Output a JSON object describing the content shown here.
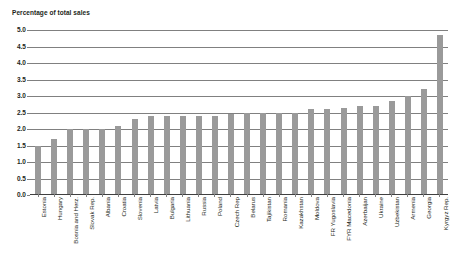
{
  "chart_data": {
    "type": "bar",
    "title": "Percentage of total sales",
    "subtitle": "",
    "xlabel": "",
    "ylabel": "Percentage of total sales",
    "ylim": [
      0.0,
      5.0
    ],
    "ytick_labels": [
      "5.0",
      "4.5",
      "4.0",
      "3.5",
      "3.0",
      "2.5",
      "2.0",
      "1.5",
      "1.0",
      "0.5",
      "0.0"
    ],
    "ytick_values": [
      5.0,
      4.5,
      4.0,
      3.5,
      3.0,
      2.5,
      2.0,
      1.5,
      1.0,
      0.5,
      0.0
    ],
    "grid": true,
    "legend": "none",
    "bar_color": "#9a9a9a",
    "categories": [
      "Estonia",
      "Hungary",
      "Bosnia and Herz.",
      "Slovak Rep.",
      "Albania",
      "Croatia",
      "Slovenia",
      "Latvia",
      "Bulgaria",
      "Lithuania",
      "Russia",
      "Poland",
      "Czech Rep",
      "Belarus",
      "Tajikistan",
      "Romania",
      "Kazakhstan",
      "Moldova",
      "FR Yugoslavia",
      "FYR Macedonia",
      "Azerbaijan",
      "Ukraine",
      "Uzbekistan",
      "Armenia",
      "Georgia",
      "Kyrgyz Rep."
    ],
    "values": [
      1.5,
      1.7,
      2.0,
      2.0,
      2.0,
      2.1,
      2.3,
      2.4,
      2.4,
      2.4,
      2.4,
      2.4,
      2.45,
      2.5,
      2.5,
      2.5,
      2.5,
      2.6,
      2.6,
      2.65,
      2.7,
      2.7,
      2.85,
      3.0,
      3.2,
      4.85
    ]
  },
  "chart_meta": {
    "unit_caption": "Percentage of total sales"
  }
}
